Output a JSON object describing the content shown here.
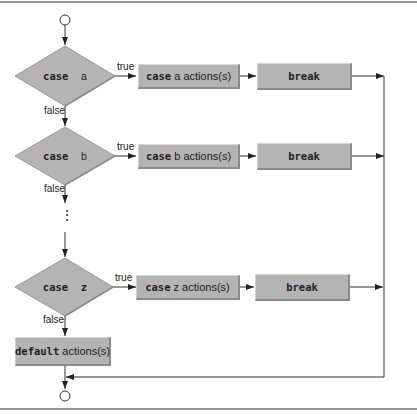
{
  "diagram": {
    "type": "flowchart",
    "cases": [
      {
        "condition_keyword": "case",
        "condition_value": "a",
        "action_keyword": "case",
        "action_text": "a actions(s)",
        "break_label": "break",
        "true_label": "true",
        "false_label": "false"
      },
      {
        "condition_keyword": "case",
        "condition_value": "b",
        "action_keyword": "case",
        "action_text": "b actions(s)",
        "break_label": "break",
        "true_label": "true",
        "false_label": "false"
      },
      {
        "condition_keyword": "case",
        "condition_value": "z",
        "action_keyword": "case",
        "action_text": "z actions(s)",
        "break_label": "break",
        "true_label": "true",
        "false_label": "false"
      }
    ],
    "ellipsis": "⋮",
    "default": {
      "keyword": "default",
      "text": "actions(s)"
    },
    "colors": {
      "shape_fill": "#b4b4b4",
      "shape_shadow": "#8a8a8a",
      "line": "#333333",
      "rule": "#9a9a9a"
    }
  }
}
